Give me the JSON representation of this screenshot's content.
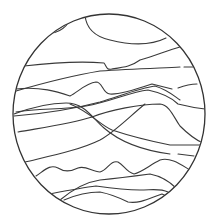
{
  "figure": {
    "stroke_color": "#3a3a3a",
    "rim_color": "#333333",
    "background": "#ffffff",
    "circle": {
      "cx": 109,
      "cy": 114,
      "rx": 96,
      "ry": 100
    },
    "lines": [
      {
        "id": "top-left-arc",
        "d": "M44 32 C55 36 66 28 70 20"
      },
      {
        "id": "top-sweep",
        "d": "M85 15 C86 26 92 36 110 40 C130 45 150 46 166 38"
      },
      {
        "id": "upper-long-1",
        "d": "M24 66 C50 63 80 61 104 63 C107 67 106 70 112 69 C125 67 132 66 140 60 C155 56 168 50 180 47"
      },
      {
        "id": "upper-long-2",
        "d": "M16 91 C40 84 70 76 100 71 C130 69 160 68 180 67 M184 67 L194 67"
      },
      {
        "id": "peak-line",
        "d": "M16 89 C40 86 58 92 70 96 C78 92 86 83 96 82 C103 82 102 93 110 94 C120 95 140 88 152 84 C160 86 168 88 172 89 M178 88 C186 85 192 84 197 84"
      },
      {
        "id": "double-band-a",
        "d": "M14 116 C40 114 70 110 100 102 C120 96 140 88 155 86 C168 90 174 96 180 100"
      },
      {
        "id": "double-band-b",
        "d": "M16 112 C40 108 60 110 86 106 C110 102 130 92 148 90 C162 93 172 98 178 104 C186 106 196 108 205 109"
      },
      {
        "id": "mid-wave",
        "d": "M14 114 C30 108 50 103 66 103 C85 103 92 118 104 128 C120 142 140 150 170 154 M178 154 L194 156"
      },
      {
        "id": "mid-hump",
        "d": "M18 132 C40 128 70 124 92 117 C110 110 140 104 160 104 C170 105 174 118 180 126 C188 134 196 140 203 143"
      },
      {
        "id": "cross-line",
        "d": "M70 104 C90 112 100 125 112 130 C130 136 150 141 170 145 C180 145 190 145 200 145"
      },
      {
        "id": "lower-diagonal",
        "d": "M25 162 C50 156 80 150 100 140 C115 132 130 116 145 104"
      },
      {
        "id": "wave-band",
        "d": "M36 176 C45 170 50 164 58 168 C64 172 70 172 78 168 C86 165 92 172 100 172 C108 170 110 160 118 162 C124 165 126 172 134 174 C142 172 150 165 160 160 C170 157 180 164 190 170"
      },
      {
        "id": "lower-rise-1",
        "d": "M60 200 C72 190 86 182 100 180 C120 178 135 176 150 174 C160 176 170 182 176 188"
      },
      {
        "id": "lower-rise-2",
        "d": "M44 195 C60 192 80 188 96 186 C110 188 124 190 140 190 C152 190 160 188 168 192"
      },
      {
        "id": "lower-rise-3",
        "d": "M64 200 C78 194 90 192 100 192 C110 194 120 198 128 202 C140 204 150 198 162 194 C168 196 170 198 172 200"
      }
    ]
  }
}
